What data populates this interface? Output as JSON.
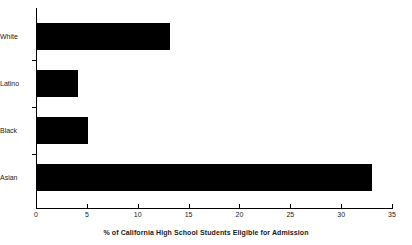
{
  "chart_data": {
    "type": "bar",
    "orientation": "horizontal",
    "title": "",
    "xlabel": "% of California High School Students Eligible for Admission",
    "ylabel": "",
    "categories": [
      "White",
      "Latino",
      "Black",
      "Asian"
    ],
    "values": [
      13.2,
      4.1,
      5.1,
      33.0
    ],
    "series": [
      {
        "name": "% Eligible for Admission",
        "values": [
          13.2,
          4.1,
          5.1,
          33.0
        ]
      }
    ],
    "xlim": [
      0,
      35
    ],
    "xticks": [
      0,
      5,
      10,
      15,
      20,
      25,
      30,
      35
    ],
    "xtick_labels": [
      "0",
      "5",
      "10",
      "15",
      "20",
      "25",
      "30",
      "35"
    ],
    "grid": false,
    "legend": false,
    "bar_color": "#000000",
    "axis_color": "#000000",
    "background_color": "#ffffff"
  }
}
